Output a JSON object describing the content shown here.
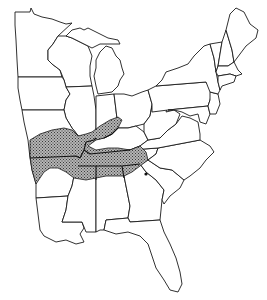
{
  "map": {
    "type": "distribution range map",
    "region": "Eastern United States",
    "colors": {
      "background": "#ffffff",
      "outline": "#1a1a1a",
      "range_fill": "#9a9a9a",
      "marker": "#111111"
    },
    "shaded_range": {
      "label": "",
      "states_covered": [
        "Missouri (southern)",
        "Arkansas (northern)",
        "Illinois (southern tip)",
        "Indiana (southern)",
        "Kentucky (western)",
        "Tennessee",
        "Mississippi (northern)",
        "Alabama (northern)",
        "Georgia (northwestern)"
      ]
    },
    "markers": [
      {
        "name": "isolated-occurrence",
        "location": "northwestern South Carolina"
      }
    ],
    "states_shown": [
      "Minnesota",
      "Wisconsin",
      "Michigan",
      "Iowa",
      "Illinois",
      "Indiana",
      "Ohio",
      "Missouri",
      "Kentucky",
      "Tennessee",
      "Arkansas",
      "Louisiana",
      "Mississippi",
      "Alabama",
      "Georgia",
      "Florida",
      "South Carolina",
      "North Carolina",
      "Virginia",
      "West Virginia",
      "Pennsylvania",
      "New York",
      "Maryland",
      "Delaware",
      "New Jersey",
      "Connecticut",
      "Rhode Island",
      "Massachusetts",
      "Vermont",
      "New Hampshire",
      "Maine"
    ]
  }
}
